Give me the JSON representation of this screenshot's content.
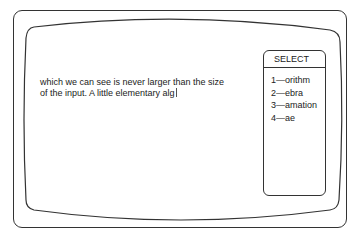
{
  "editor": {
    "lines": [
      "which we can see is never larger than the size",
      "of the input. A little elementary alg"
    ]
  },
  "select_panel": {
    "title": "SELECT",
    "items": [
      {
        "key": "1",
        "label": "1—orithm"
      },
      {
        "key": "2",
        "label": "2—ebra"
      },
      {
        "key": "3",
        "label": "3—amation"
      },
      {
        "key": "4",
        "label": "4—ae"
      }
    ]
  }
}
